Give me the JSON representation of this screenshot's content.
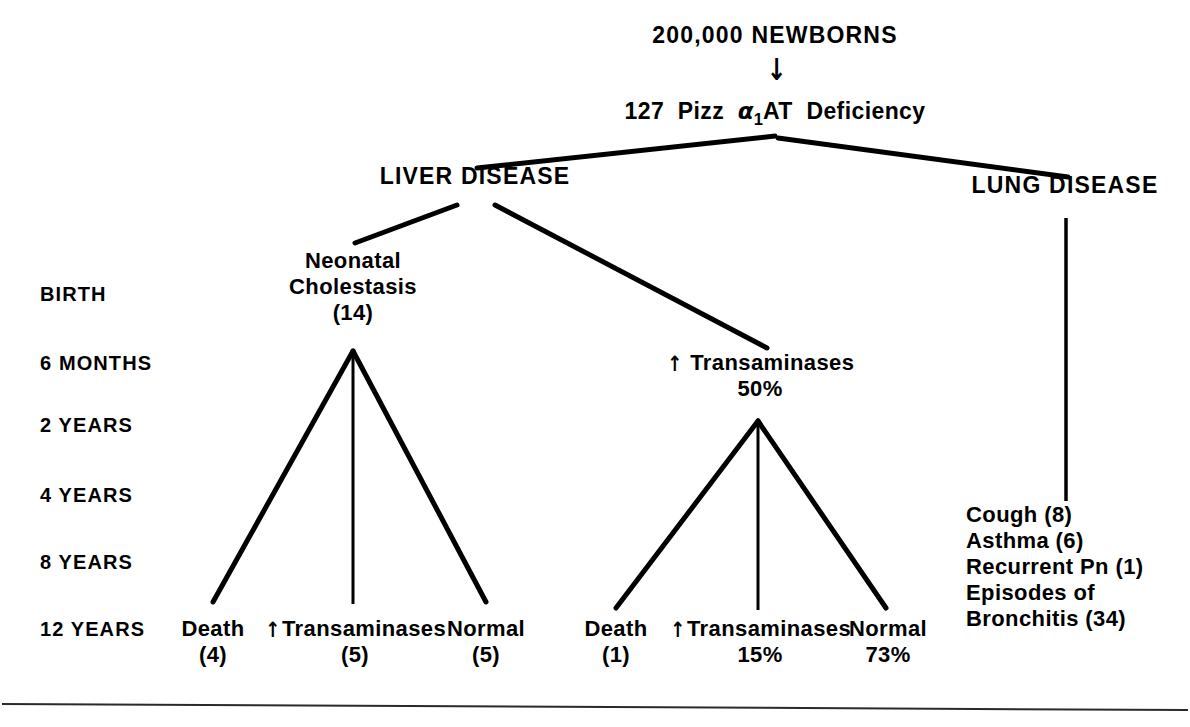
{
  "figure": {
    "type": "flowchart",
    "title_node": "200,000 NEWBORNS",
    "arrow_glyph": "↓",
    "up_arrow_glyph": "↑"
  },
  "nodes": {
    "newborns": {
      "text": "200,000 NEWBORNS"
    },
    "deficiency": {
      "count": "127",
      "phenotype": "Pizz",
      "alpha": "α",
      "subscript": "1",
      "protein": "AT",
      "condition": "Deficiency",
      "full_text": "127 Pizz α1AT Deficiency"
    },
    "liver_disease": {
      "text": "LIVER DISEASE"
    },
    "lung_disease": {
      "text": "LUNG DISEASE"
    },
    "neonatal_cholestasis": {
      "line1": "Neonatal",
      "line2": "Cholestasis",
      "line3": "(14)"
    },
    "transaminases_mid": {
      "label": "Transaminases",
      "value": "50%"
    },
    "left_outcomes": [
      {
        "label": "Death",
        "value": "(4)"
      },
      {
        "label": "Transaminases",
        "value": "(5)",
        "arrow": true
      },
      {
        "label": "Normal",
        "value": "(5)"
      }
    ],
    "mid_outcomes": [
      {
        "label": "Death",
        "value": "(1)"
      },
      {
        "label": "Transaminases",
        "value": "15%",
        "arrow": true
      },
      {
        "label": "Normal",
        "value": "73%"
      }
    ],
    "lung_findings": [
      "Cough (8)",
      "Asthma (6)",
      "Recurrent Pn (1)",
      "Episodes of",
      "Bronchitis (34)"
    ]
  },
  "timeline": {
    "labels": [
      "BIRTH",
      "6 MONTHS",
      "2 YEARS",
      "4 YEARS",
      "8 YEARS",
      "12 YEARS"
    ]
  },
  "colors": {
    "ink": "#000000",
    "background": "#ffffff"
  }
}
